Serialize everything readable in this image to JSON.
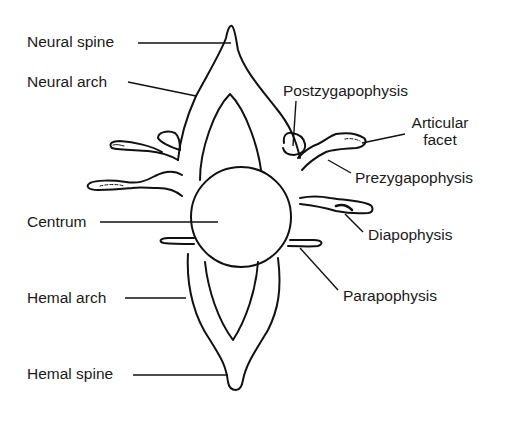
{
  "diagram": {
    "labels": {
      "neural_spine": "Neural spine",
      "neural_arch": "Neural arch",
      "postzygapophysis": "Postzygapophysis",
      "articular_facet_1": "Articular",
      "articular_facet_2": "facet",
      "prezygapophysis": "Prezygapophysis",
      "centrum": "Centrum",
      "diapophysis": "Diapophysis",
      "hemal_arch": "Hemal arch",
      "parapophysis": "Parapophysis",
      "hemal_spine": "Hemal spine"
    },
    "colors": {
      "stroke": "#111111",
      "background": "#ffffff",
      "text": "#1a1a1a"
    }
  }
}
